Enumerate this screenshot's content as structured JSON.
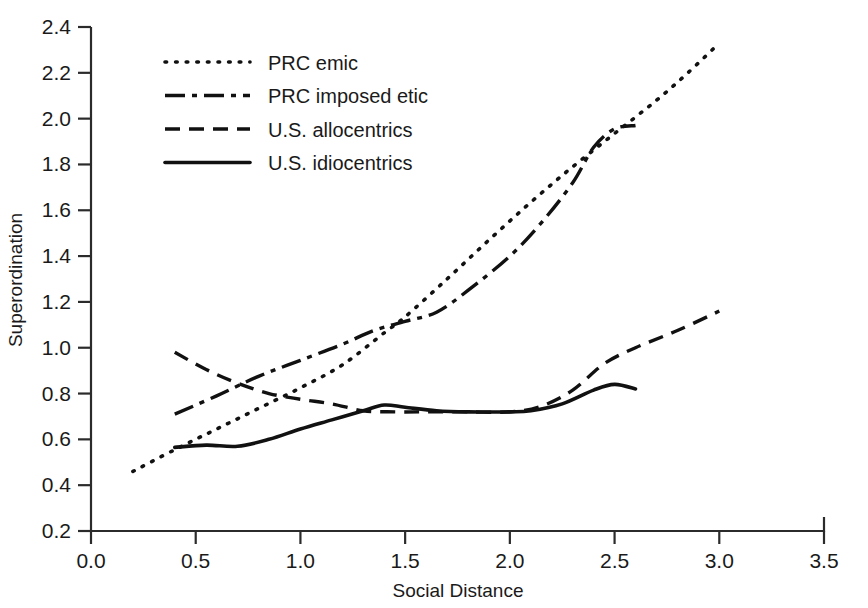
{
  "chart_data": {
    "type": "line",
    "title": "",
    "xlabel": "Social Distance",
    "ylabel": "Superordination",
    "xlim": [
      0.0,
      3.5
    ],
    "ylim": [
      0.2,
      2.4
    ],
    "xticks": [
      "0.0",
      "0.5",
      "1.0",
      "1.5",
      "2.0",
      "2.5",
      "3.0",
      "3.5"
    ],
    "yticks": [
      "0.2",
      "0.4",
      "0.6",
      "0.8",
      "1.0",
      "1.2",
      "1.4",
      "1.6",
      "1.8",
      "2.0",
      "2.2",
      "2.4"
    ],
    "grid": false,
    "legend_position": "upper-left",
    "series": [
      {
        "name": "PRC emic",
        "style": "dotted",
        "color": "#111111",
        "points": [
          [
            0.2,
            0.46
          ],
          [
            0.4,
            0.555
          ],
          [
            0.6,
            0.645
          ],
          [
            0.8,
            0.735
          ],
          [
            1.0,
            0.825
          ],
          [
            1.2,
            0.925
          ],
          [
            1.4,
            1.065
          ],
          [
            1.5,
            1.135
          ],
          [
            1.7,
            1.3
          ],
          [
            1.9,
            1.47
          ],
          [
            2.1,
            1.635
          ],
          [
            2.3,
            1.79
          ],
          [
            2.5,
            1.935
          ],
          [
            2.7,
            2.08
          ],
          [
            2.85,
            2.2
          ],
          [
            3.0,
            2.33
          ]
        ]
      },
      {
        "name": "PRC imposed etic",
        "style": "dashdot",
        "color": "#111111",
        "points": [
          [
            0.4,
            0.71
          ],
          [
            0.6,
            0.79
          ],
          [
            0.8,
            0.875
          ],
          [
            1.0,
            0.945
          ],
          [
            1.2,
            1.015
          ],
          [
            1.35,
            1.075
          ],
          [
            1.5,
            1.115
          ],
          [
            1.65,
            1.155
          ],
          [
            1.8,
            1.25
          ],
          [
            2.0,
            1.4
          ],
          [
            2.15,
            1.545
          ],
          [
            2.3,
            1.72
          ],
          [
            2.4,
            1.875
          ],
          [
            2.5,
            1.955
          ],
          [
            2.6,
            1.97
          ]
        ]
      },
      {
        "name": "U.S. allocentrics",
        "style": "dashed",
        "color": "#111111",
        "points": [
          [
            0.4,
            0.98
          ],
          [
            0.55,
            0.905
          ],
          [
            0.7,
            0.845
          ],
          [
            0.85,
            0.8
          ],
          [
            1.0,
            0.775
          ],
          [
            1.15,
            0.755
          ],
          [
            1.3,
            0.725
          ],
          [
            1.45,
            0.72
          ],
          [
            1.6,
            0.72
          ],
          [
            1.8,
            0.72
          ],
          [
            2.0,
            0.72
          ],
          [
            2.15,
            0.745
          ],
          [
            2.3,
            0.815
          ],
          [
            2.45,
            0.93
          ],
          [
            2.6,
            1.0
          ],
          [
            2.8,
            1.075
          ],
          [
            3.0,
            1.16
          ]
        ]
      },
      {
        "name": "U.S. idiocentrics",
        "style": "solid",
        "color": "#111111",
        "points": [
          [
            0.4,
            0.565
          ],
          [
            0.55,
            0.575
          ],
          [
            0.7,
            0.57
          ],
          [
            0.85,
            0.6
          ],
          [
            1.0,
            0.645
          ],
          [
            1.15,
            0.685
          ],
          [
            1.3,
            0.725
          ],
          [
            1.4,
            0.75
          ],
          [
            1.5,
            0.74
          ],
          [
            1.65,
            0.725
          ],
          [
            1.8,
            0.72
          ],
          [
            2.0,
            0.72
          ],
          [
            2.1,
            0.725
          ],
          [
            2.25,
            0.755
          ],
          [
            2.4,
            0.815
          ],
          [
            2.5,
            0.84
          ],
          [
            2.6,
            0.82
          ]
        ]
      }
    ]
  },
  "legend": {
    "items": [
      {
        "label": "PRC emic"
      },
      {
        "label": "PRC imposed etic"
      },
      {
        "label": "U.S. allocentrics"
      },
      {
        "label": "U.S. idiocentrics"
      }
    ]
  }
}
